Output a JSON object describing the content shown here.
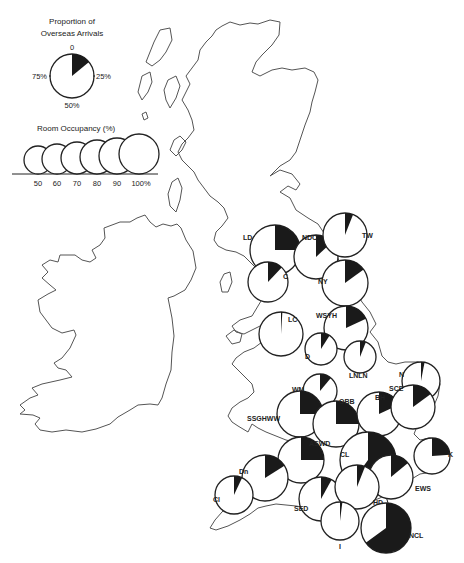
{
  "legend": {
    "proportion_title_line1": "Proportion of",
    "proportion_title_line2": "Overseas Arrivals",
    "proportion_ticks": {
      "top": "0",
      "right": "25%",
      "bottom": "50%",
      "left": "75%"
    },
    "occupancy_title": "Room Occupancy (%)",
    "occupancy_sizes": [
      "50",
      "60",
      "70",
      "80",
      "90",
      "100%"
    ]
  },
  "regions": [
    {
      "code": "LD",
      "cx": 275,
      "cy": 250,
      "r": 25,
      "overseas": 0.25,
      "lx": 243,
      "ly": 240
    },
    {
      "code": "C",
      "cx": 268,
      "cy": 282,
      "r": 20,
      "overseas": 0.12,
      "lx": 283,
      "ly": 279
    },
    {
      "code": "NDC",
      "cx": 316,
      "cy": 257,
      "r": 22,
      "overseas": 0.13,
      "lx": 302,
      "ly": 240
    },
    {
      "code": "TW",
      "cx": 345,
      "cy": 235,
      "r": 22,
      "overseas": 0.06,
      "lx": 362,
      "ly": 238
    },
    {
      "code": "NY",
      "cx": 345,
      "cy": 283,
      "r": 23,
      "overseas": 0.15,
      "lx": 318,
      "ly": 284
    },
    {
      "code": "WSYH",
      "cx": 346,
      "cy": 328,
      "r": 22,
      "overseas": 0.18,
      "lx": 316,
      "ly": 318
    },
    {
      "code": "LC",
      "cx": 281,
      "cy": 334,
      "r": 22,
      "overseas": 0.01,
      "lx": 288,
      "ly": 322
    },
    {
      "code": "D",
      "cx": 321,
      "cy": 349,
      "r": 16,
      "overseas": 0.09,
      "lx": 305,
      "ly": 359
    },
    {
      "code": "LNLN",
      "cx": 360,
      "cy": 357,
      "r": 16,
      "overseas": 0.06,
      "lx": 349,
      "ly": 378
    },
    {
      "code": "N",
      "cx": 421,
      "cy": 381,
      "r": 19,
      "overseas": 0.03,
      "lx": 399,
      "ly": 377
    },
    {
      "code": "WM",
      "cx": 320,
      "cy": 391,
      "r": 17,
      "overseas": 0.11,
      "lx": 292,
      "ly": 392
    },
    {
      "code": "SSGHWW",
      "cx": 300,
      "cy": 414,
      "r": 23,
      "overseas": 0.25,
      "lx": 247,
      "ly": 421
    },
    {
      "code": "OBB",
      "cx": 336,
      "cy": 424,
      "r": 23,
      "overseas": 0.25,
      "lx": 339,
      "ly": 404
    },
    {
      "code": "BH",
      "cx": 379,
      "cy": 414,
      "r": 22,
      "overseas": 0.18,
      "lx": 375,
      "ly": 400
    },
    {
      "code": "SCE",
      "cx": 413,
      "cy": 407,
      "r": 22,
      "overseas": 0.15,
      "lx": 389,
      "ly": 391
    },
    {
      "code": "CL",
      "cx": 368,
      "cy": 460,
      "r": 28,
      "overseas": 0.6,
      "lx": 340,
      "ly": 457
    },
    {
      "code": "K",
      "cx": 432,
      "cy": 456,
      "r": 18,
      "overseas": 0.24,
      "lx": 448,
      "ly": 457
    },
    {
      "code": "EWS",
      "cx": 391,
      "cy": 477,
      "r": 22,
      "overseas": 0.14,
      "lx": 415,
      "ly": 491
    },
    {
      "code": "ASWD",
      "cx": 301,
      "cy": 460,
      "r": 23,
      "overseas": 0.25,
      "lx": 309,
      "ly": 446
    },
    {
      "code": "Dn",
      "cx": 265,
      "cy": 478,
      "r": 23,
      "overseas": 0.16,
      "lx": 239,
      "ly": 474
    },
    {
      "code": "Cl",
      "cx": 234,
      "cy": 495,
      "r": 19,
      "overseas": 0.07,
      "lx": 213,
      "ly": 502
    },
    {
      "code": "SED",
      "cx": 321,
      "cy": 499,
      "r": 22,
      "overseas": 0.08,
      "lx": 294,
      "ly": 511
    },
    {
      "code": "HD",
      "cx": 357,
      "cy": 487,
      "r": 22,
      "overseas": 0.06,
      "lx": 373,
      "ly": 505
    },
    {
      "code": "I",
      "cx": 340,
      "cy": 521,
      "r": 19,
      "overseas": 0.02,
      "lx": 339,
      "ly": 549
    },
    {
      "code": "NCL",
      "cx": 386,
      "cy": 528,
      "r": 25,
      "overseas": 0.65,
      "lx": 409,
      "ly": 538
    }
  ],
  "colors": {
    "wedge": "#1a1a1a",
    "outline": "#222222",
    "coast": "#555555"
  }
}
